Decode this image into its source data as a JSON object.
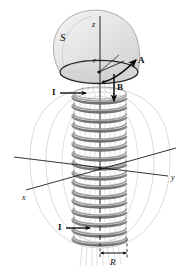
{
  "figure": {
    "background_color": "#ffffff",
    "width": 189,
    "height": 276,
    "colors": {
      "ink": "#0d0d0d",
      "coil_wire": "#8c8c8c",
      "coil_wire_dark": "#6e6e6e",
      "surface_fill": "#e2e2e2",
      "surface_edge": "#9a9a9a",
      "rim_edge": "#1a1a1a",
      "field_line": "#cccccc",
      "axis": "#111111"
    },
    "labels": [
      {
        "id": "surface-s",
        "text": "S",
        "x": 60,
        "y": 32,
        "size": 11,
        "style": "script",
        "name": "surface-s-label"
      },
      {
        "id": "axis-z",
        "text": "z",
        "x": 92,
        "y": 21,
        "size": 8,
        "style": "italic",
        "name": "z-axis-label"
      },
      {
        "id": "radius-r",
        "text": "r",
        "x": 93,
        "y": 57,
        "size": 8,
        "style": "italic",
        "name": "radius-r-label"
      },
      {
        "id": "vector-a",
        "text": "A",
        "x": 138,
        "y": 56,
        "size": 9,
        "style": "bold",
        "name": "vector-a-label"
      },
      {
        "id": "vector-b",
        "text": "B",
        "x": 117,
        "y": 83,
        "size": 9,
        "style": "bold",
        "name": "vector-b-label"
      },
      {
        "id": "current-top",
        "text": "I",
        "x": 52,
        "y": 94,
        "size": 9,
        "style": "bold",
        "name": "current-top-label"
      },
      {
        "id": "current-bot",
        "text": "I",
        "x": 58,
        "y": 228,
        "size": 9,
        "style": "bold",
        "name": "current-bottom-label"
      },
      {
        "id": "axis-x",
        "text": "x",
        "x": 22,
        "y": 194,
        "size": 8,
        "style": "italic",
        "name": "x-axis-label"
      },
      {
        "id": "axis-y",
        "text": "y",
        "x": 171,
        "y": 174,
        "size": 8,
        "style": "italic",
        "name": "y-axis-label"
      },
      {
        "id": "radius-R",
        "text": "R",
        "x": 114,
        "y": 261,
        "size": 9,
        "style": "italic",
        "name": "radius-R-label"
      }
    ],
    "geometry": {
      "solenoid": {
        "axis_x": 100,
        "top_y": 92,
        "bottom_y": 244,
        "turns": 16,
        "radius_x": 26,
        "radius_y": 6,
        "turn_spacing": 9.6
      },
      "surface": {
        "center_x": 99,
        "rim_y": 72,
        "rim_rx": 40,
        "rim_ry": 12,
        "dome_tilt_deg": -22
      },
      "axes": {
        "origin_x": 100,
        "origin_y": 168,
        "z": {
          "tip_x": 100,
          "tip_y": 16
        },
        "x": {
          "tip_x": 26,
          "tip_y": 190
        },
        "y": {
          "tip_x": 166,
          "tip_y": 173
        }
      },
      "dimension_R": {
        "left_x": 100,
        "right_x": 127,
        "y": 254,
        "label_y": 263
      }
    },
    "caption_elements": {
      "surface": "S",
      "z_axis": "z",
      "radius": "r",
      "vector_potential": "A",
      "magnetic_field": "B",
      "current": "I",
      "x_axis": "x",
      "y_axis": "y",
      "coil_radius": "R"
    }
  }
}
